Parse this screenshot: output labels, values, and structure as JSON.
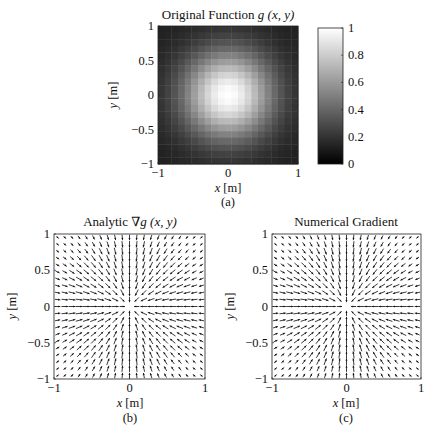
{
  "figure": {
    "panels": {
      "a": {
        "title_prefix": "Original Function ",
        "title_math": "g (x, y)",
        "xlabel_var": "x",
        "xlabel_unit": " [m]",
        "ylabel_var": "y",
        "ylabel_unit": " [m]",
        "caption": "(a)",
        "xticks": [
          "−1",
          "0",
          "1"
        ],
        "yticks": [
          "1",
          "0.5",
          "0",
          "−0.5",
          "−1"
        ]
      },
      "colorbar": {
        "ticks": [
          "1",
          "0.8",
          "0.6",
          "0.4",
          "0.2",
          "0"
        ]
      },
      "b": {
        "title_prefix": "Analytic ",
        "title_math": "∇g (x, y)",
        "xlabel_var": "x",
        "xlabel_unit": " [m]",
        "ylabel_var": "y",
        "ylabel_unit": " [m]",
        "caption": "(b)",
        "xticks": [
          "−1",
          "0",
          "1"
        ],
        "yticks": [
          "1",
          "0.5",
          "0",
          "−0.5",
          "−1"
        ]
      },
      "c": {
        "title_prefix": "Numerical Gradient",
        "title_math": "",
        "xlabel_var": "x",
        "xlabel_unit": " [m]",
        "ylabel_var": "y",
        "ylabel_unit": " [m]",
        "caption": "(c)",
        "xticks": [
          "−1",
          "0",
          "1"
        ],
        "yticks": [
          "1",
          "0.5",
          "0",
          "−0.5",
          "−1"
        ]
      }
    }
  },
  "chart_data": [
    {
      "type": "heatmap",
      "title": "Original Function g(x,y)",
      "xlabel": "x [m]",
      "ylabel": "y [m]",
      "xlim": [
        -1,
        1
      ],
      "ylim": [
        -1,
        1
      ],
      "grid_size": 21,
      "function": "g(x,y) = exp(-(x^2+y^2)/(2*0.45^2)), peak 1 at origin",
      "colormap": "gray",
      "clim": [
        0,
        1
      ],
      "colorbar_ticks": [
        0,
        0.2,
        0.4,
        0.6,
        0.8,
        1
      ],
      "caption": "(a)"
    },
    {
      "type": "quiver",
      "title": "Analytic ∇g(x,y)",
      "xlabel": "x [m]",
      "ylabel": "y [m]",
      "xlim": [
        -1,
        1
      ],
      "ylim": [
        -1,
        1
      ],
      "grid_size": 21,
      "description": "Arrows point toward origin (gradient of centered peak), shown normalized",
      "caption": "(b)"
    },
    {
      "type": "quiver",
      "title": "Numerical Gradient",
      "xlabel": "x [m]",
      "ylabel": "y [m]",
      "xlim": [
        -1,
        1
      ],
      "ylim": [
        -1,
        1
      ],
      "grid_size": 21,
      "description": "Arrows point toward origin, nearly identical to analytic gradient",
      "caption": "(c)"
    }
  ]
}
